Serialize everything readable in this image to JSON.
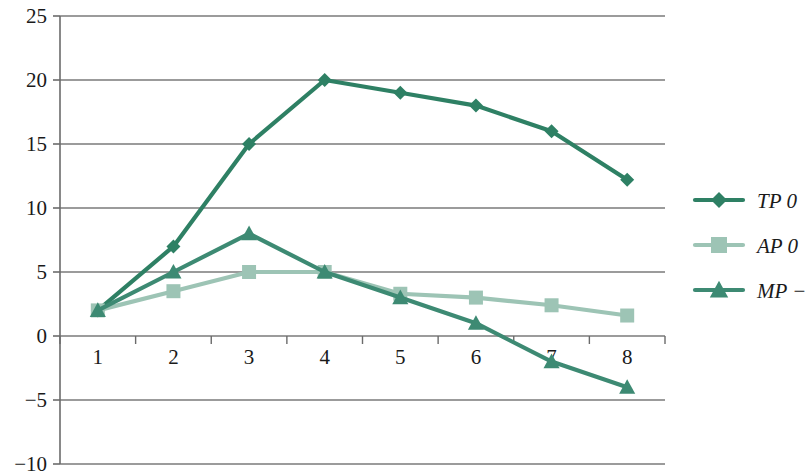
{
  "chart_data": {
    "type": "line",
    "title": "",
    "subtitle": "",
    "xlabel": "",
    "ylabel": "",
    "categories": [
      "1",
      "2",
      "3",
      "4",
      "5",
      "6",
      "7",
      "8"
    ],
    "x_tick_labels": [
      "1",
      "2",
      "3",
      "4",
      "5",
      "6",
      "7",
      "8"
    ],
    "y_tick_labels": [
      "-10",
      "-5",
      "0",
      "5",
      "10",
      "15",
      "20",
      "25"
    ],
    "y_ticks": [
      -10,
      -5,
      0,
      5,
      10,
      15,
      20,
      25
    ],
    "ylim": [
      -10,
      25
    ],
    "grid": "horizontal",
    "legend_position": "right",
    "series": [
      {
        "name": "TP 0",
        "marker": "diamond",
        "color": "#2E8064",
        "values": [
          2,
          7,
          15,
          20,
          19,
          18,
          16,
          12.2
        ]
      },
      {
        "name": "AP 0",
        "marker": "square",
        "color": "#9DC4B5",
        "values": [
          2,
          3.5,
          5,
          5,
          3.3,
          3,
          2.4,
          1.6
        ]
      },
      {
        "name": "MP −",
        "marker": "triangle",
        "color": "#3D8A73",
        "values": [
          2,
          5,
          8,
          5,
          3,
          1,
          -2,
          -4
        ]
      }
    ]
  },
  "legend": {
    "entries": [
      {
        "label": "TP 0"
      },
      {
        "label": "AP 0"
      },
      {
        "label": "MP −"
      }
    ]
  },
  "axes": {
    "y_axis_name": "value-axis",
    "x_axis_name": "category-axis",
    "axis_color": "#6b6b6b",
    "grid_color": "#7a7a7a"
  }
}
